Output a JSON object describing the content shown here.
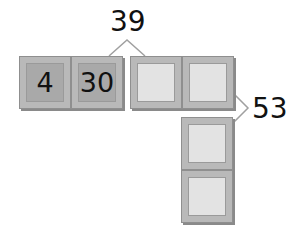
{
  "diagram": {
    "tiles": [
      {
        "id": "tile-1",
        "value": "4",
        "state": "filled"
      },
      {
        "id": "tile-2",
        "value": "30",
        "state": "filled"
      },
      {
        "id": "tile-3",
        "value": "",
        "state": "empty"
      },
      {
        "id": "tile-4",
        "value": "",
        "state": "empty"
      },
      {
        "id": "tile-5",
        "value": "",
        "state": "empty"
      },
      {
        "id": "tile-6",
        "value": "",
        "state": "empty"
      }
    ],
    "labels": {
      "top_sum": "39",
      "right_sum": "53"
    },
    "colors": {
      "tile_frame": "#b9b9b9",
      "filled_inner": "#a9a9a9",
      "empty_inner": "#e3e3e3",
      "bracket": "#a0a0a0"
    }
  }
}
